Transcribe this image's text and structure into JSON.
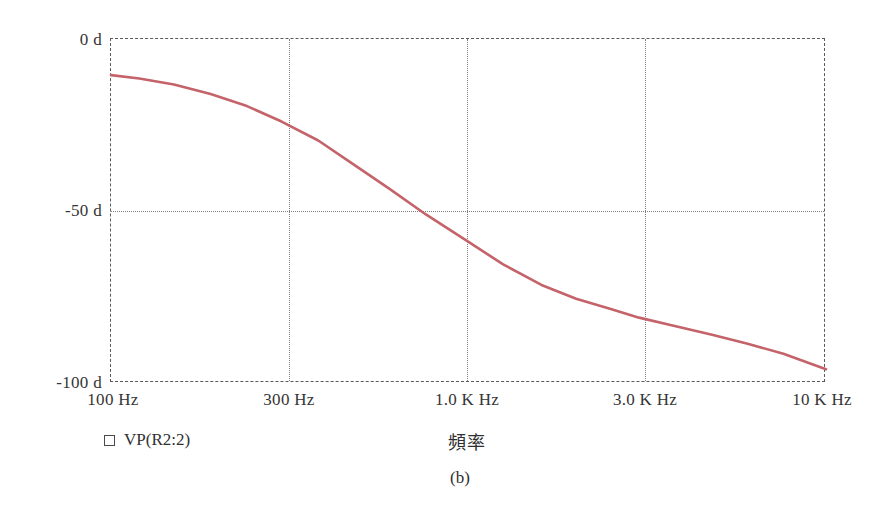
{
  "figure": {
    "caption": "(b)",
    "axis_title": "頻率",
    "legend": {
      "marker": "square-outline",
      "label": "VP(R2:2)"
    }
  },
  "chart_data": {
    "type": "line",
    "title": "",
    "subtitle": "",
    "xlabel": "頻率",
    "ylabel": "",
    "xscale": "log",
    "xlim": [
      100,
      10000
    ],
    "ylim": [
      -100,
      0
    ],
    "grid": true,
    "grid_style": "dotted",
    "frame_style": "dashed",
    "legend_position": "below-left",
    "xticks": [
      100,
      300,
      1000,
      3000,
      10000
    ],
    "xticklabels": [
      "100 Hz",
      "300 Hz",
      "1.0 K Hz",
      "3.0 K Hz",
      "10 K Hz"
    ],
    "yticks": [
      0,
      -50,
      -100
    ],
    "yticklabels": [
      "0 d",
      "-50 d",
      "-100 d"
    ],
    "series": [
      {
        "name": "VP(R2:2)",
        "color": "#c4636a",
        "x": [
          100,
          120,
          150,
          190,
          240,
          300,
          380,
          470,
          600,
          760,
          1000,
          1250,
          1600,
          2000,
          2500,
          3000,
          3800,
          4800,
          6000,
          7600,
          10000
        ],
        "values": [
          -10.5,
          -11.5,
          -13.2,
          -16.0,
          -19.5,
          -24.0,
          -29.5,
          -36.0,
          -43.5,
          -51.0,
          -59.0,
          -65.5,
          -71.5,
          -75.5,
          -78.5,
          -81.0,
          -83.5,
          -86.0,
          -88.5,
          -91.5,
          -96.0
        ]
      }
    ]
  }
}
